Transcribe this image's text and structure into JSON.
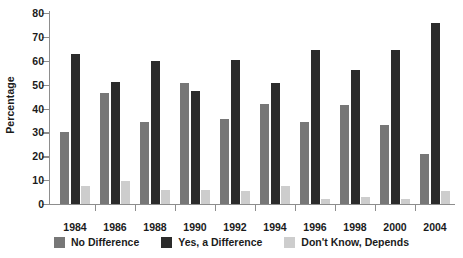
{
  "chart_data": {
    "type": "bar",
    "title": "",
    "subtitle": "",
    "xlabel": "",
    "ylabel": "Percentage",
    "ylim": [
      0,
      80
    ],
    "yticks": [
      0,
      10,
      20,
      30,
      40,
      50,
      60,
      70,
      80
    ],
    "ytick_labels": [
      "0",
      "10",
      "20",
      "30",
      "40",
      "50",
      "60",
      "70",
      "80"
    ],
    "grid": false,
    "legend_position": "bottom",
    "categories": [
      "1984",
      "1986",
      "1988",
      "1990",
      "1992",
      "1994",
      "1996",
      "1998",
      "2000",
      "2004"
    ],
    "series": [
      {
        "name": "No Difference",
        "color": "#777777",
        "values": [
          30,
          46.5,
          34.5,
          50.5,
          35.5,
          42,
          34.5,
          41.5,
          33,
          21
        ]
      },
      {
        "name": "Yes, a Difference",
        "color": "#2b2b2b",
        "values": [
          63,
          51,
          60,
          47.5,
          60.5,
          50.5,
          64.5,
          56,
          64.5,
          76
        ]
      },
      {
        "name": "Don't Know, Depends",
        "color": "#cdcdcd",
        "values": [
          7.5,
          9.5,
          6,
          6,
          5.5,
          7.5,
          2,
          3,
          2,
          5.5
        ]
      }
    ]
  },
  "axis": {
    "y_title": "Percentage"
  },
  "legend": {
    "items": [
      {
        "label": "No Difference",
        "color": "#777777"
      },
      {
        "label": "Yes, a Difference",
        "color": "#2b2b2b"
      },
      {
        "label": "Don't Know, Depends",
        "color": "#cdcdcd"
      }
    ]
  }
}
